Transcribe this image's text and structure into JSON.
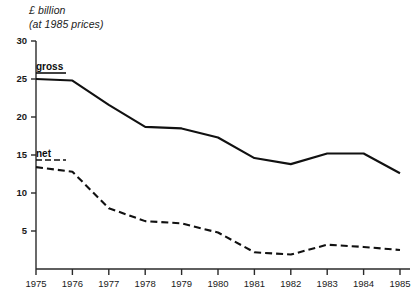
{
  "chart_data": {
    "type": "line",
    "title": "£ billion",
    "subtitle": "(at 1985 prices)",
    "xlabel": "",
    "ylabel": "£ billion (at 1985 prices)",
    "categories": [
      "1975",
      "1976",
      "1977",
      "1978",
      "1979",
      "1980",
      "1981",
      "1982",
      "1983",
      "1984",
      "1985"
    ],
    "x": [
      1975,
      1976,
      1977,
      1978,
      1979,
      1980,
      1981,
      1982,
      1983,
      1984,
      1985
    ],
    "xlim": [
      1975,
      1985
    ],
    "ylim": [
      0,
      30
    ],
    "yticks": [
      5,
      10,
      15,
      20,
      25,
      30
    ],
    "ytick_labels": [
      "5",
      "10",
      "15",
      "20",
      "25",
      "30"
    ],
    "grid": false,
    "legend_position": "inline-on-lines",
    "series": [
      {
        "name": "gross",
        "style": "solid",
        "color": "#111111",
        "values": [
          25.0,
          24.8,
          21.6,
          18.7,
          18.5,
          17.3,
          14.6,
          13.8,
          15.2,
          15.2,
          12.6
        ]
      },
      {
        "name": "net",
        "style": "dashed",
        "color": "#111111",
        "values": [
          13.4,
          12.8,
          8.0,
          6.3,
          6.0,
          4.8,
          2.2,
          1.9,
          3.2,
          2.9,
          2.5
        ]
      }
    ],
    "annotations": [
      {
        "text": "gross",
        "series": "gross",
        "at_x": 1975
      },
      {
        "text": "net",
        "series": "net",
        "at_x": 1975
      }
    ]
  },
  "axis": {
    "y_tick_labels": [
      "30",
      "25",
      "20",
      "15",
      "10",
      "5"
    ],
    "x_tick_labels": [
      "1975",
      "1976",
      "1977",
      "1978",
      "1979",
      "1980",
      "1981",
      "1982",
      "1983",
      "1984",
      "1985"
    ]
  },
  "labels": {
    "gross": "gross",
    "net": "net"
  },
  "colors": {
    "line": "#111111",
    "axis": "#2a2a2a",
    "background": "#ffffff",
    "text": "#1a1a1a"
  }
}
